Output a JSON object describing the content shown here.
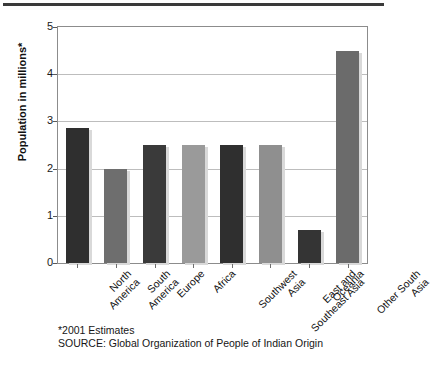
{
  "figure": {
    "axis_title_y": "Population in millions*",
    "footnote": "*2001 Estimates",
    "source": "SOURCE: Global Organization of People of Indian Origin"
  },
  "chart_data": {
    "type": "bar",
    "title": "",
    "xlabel": "",
    "ylabel": "Population in millions*",
    "ylim": [
      0,
      5
    ],
    "yticks": [
      0,
      1,
      2,
      3,
      4,
      5
    ],
    "ytick_labels": [
      "0",
      "1",
      "2",
      "3",
      "4",
      "5"
    ],
    "grid": true,
    "legend": "none",
    "categories": [
      "North America",
      "South America",
      "Europe",
      "Africa",
      "Southwest Asia",
      "East and Southeast Asia",
      "Oceania",
      "Other South Asia"
    ],
    "values": [
      2.85,
      2.0,
      2.5,
      2.5,
      2.5,
      2.5,
      0.7,
      4.5
    ],
    "bar_colors": [
      "#2f2f2f",
      "#6e6e6e",
      "#3a3a3a",
      "#9a9a9a",
      "#2f2f2f",
      "#8f8f8f",
      "#343434",
      "#6b6b6b"
    ]
  },
  "colors": {
    "frame": "#8c8c8c",
    "grid": "#bdbdbd",
    "rule": "#3a3a3a",
    "text": "#161616"
  }
}
